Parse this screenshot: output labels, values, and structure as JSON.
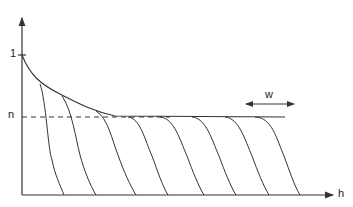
{
  "diagram": {
    "y_axis_ticks": [
      {
        "label": "1"
      },
      {
        "label": "n"
      }
    ],
    "x_axis_label": "h",
    "width_annotation": "w",
    "curve_count": 8,
    "colors": {
      "line": "#333333",
      "background": "#ffffff"
    }
  }
}
